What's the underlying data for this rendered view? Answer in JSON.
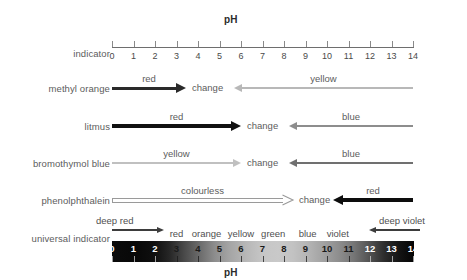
{
  "title_top": "pH",
  "title_bottom": "pH",
  "scale": {
    "min": 0,
    "max": 14,
    "ticks": [
      "0",
      "1",
      "2",
      "3",
      "4",
      "5",
      "6",
      "7",
      "8",
      "9",
      "10",
      "11",
      "12",
      "13",
      "14"
    ]
  },
  "rows": {
    "indicator": {
      "label": "indicator"
    },
    "methyl_orange": {
      "label": "methyl orange",
      "left_color_label": "red",
      "change_label": "change",
      "right_color_label": "yellow",
      "left_color": "#2a2a2a",
      "right_color": "#b8b8b8"
    },
    "litmus": {
      "label": "litmus",
      "left_color_label": "red",
      "change_label": "change",
      "right_color_label": "blue",
      "left_color": "#111111",
      "right_color": "#8d8d8d"
    },
    "bromothymol_blue": {
      "label": "bromothymol blue",
      "left_color_label": "yellow",
      "change_label": "change",
      "right_color_label": "blue",
      "left_color": "#c0c0c0",
      "right_color": "#707070"
    },
    "phenolphthalein": {
      "label": "phenolphthalein",
      "left_color_label": "colourless",
      "change_label": "change",
      "right_color_label": "red",
      "left_color": "#9a9a9a",
      "right_color": "#0d0d0d"
    },
    "universal_indicator": {
      "label": "universal indicator",
      "deep_left_label": "deep red",
      "deep_right_label": "deep violet",
      "color_labels": [
        "red",
        "orange",
        "yellow",
        "green",
        "blue",
        "violet"
      ],
      "bar_numbers": [
        "0",
        "1",
        "2",
        "3",
        "4",
        "5",
        "6",
        "7",
        "8",
        "9",
        "10",
        "11",
        "12",
        "13",
        "14"
      ]
    }
  },
  "chart_data": {
    "type": "bar",
    "title": "pH",
    "xlabel": "pH",
    "ylabel": "",
    "xlim": [
      0,
      14
    ],
    "grid": false,
    "legend": "none",
    "categories": [
      "0",
      "1",
      "2",
      "3",
      "4",
      "5",
      "6",
      "7",
      "8",
      "9",
      "10",
      "11",
      "12",
      "13",
      "14"
    ],
    "series": [
      {
        "name": "methyl orange",
        "segments": [
          {
            "label": "red",
            "from": 0.0,
            "to": 3.4,
            "direction": "right",
            "color": "#2a2a2a"
          },
          {
            "label": "change",
            "from": 3.4,
            "to": 5.7,
            "direction": "none",
            "color": "#5c5c5c"
          },
          {
            "label": "yellow",
            "from": 5.7,
            "to": 14.0,
            "direction": "left",
            "color": "#b8b8b8"
          }
        ]
      },
      {
        "name": "litmus",
        "segments": [
          {
            "label": "red",
            "from": 0.0,
            "to": 6.0,
            "direction": "right",
            "color": "#111111"
          },
          {
            "label": "change",
            "from": 6.0,
            "to": 8.3,
            "direction": "none",
            "color": "#5c5c5c"
          },
          {
            "label": "blue",
            "from": 8.3,
            "to": 14.0,
            "direction": "left",
            "color": "#8d8d8d"
          }
        ]
      },
      {
        "name": "bromothymol blue",
        "segments": [
          {
            "label": "yellow",
            "from": 0.0,
            "to": 6.0,
            "direction": "right",
            "color": "#c0c0c0"
          },
          {
            "label": "change",
            "from": 6.0,
            "to": 8.3,
            "direction": "none",
            "color": "#5c5c5c"
          },
          {
            "label": "blue",
            "from": 8.3,
            "to": 14.0,
            "direction": "left",
            "color": "#707070"
          }
        ]
      },
      {
        "name": "phenolphthalein",
        "segments": [
          {
            "label": "colourless",
            "from": 0.0,
            "to": 8.4,
            "direction": "right",
            "color": "#9a9a9a"
          },
          {
            "label": "change",
            "from": 8.4,
            "to": 10.2,
            "direction": "none",
            "color": "#5c5c5c"
          },
          {
            "label": "red",
            "from": 10.2,
            "to": 14.0,
            "direction": "left",
            "color": "#0d0d0d"
          }
        ]
      },
      {
        "name": "universal indicator",
        "segments": [
          {
            "label": "deep red",
            "from": 0.0,
            "to": 2.4,
            "direction": "right",
            "color": "#4a4a4a"
          },
          {
            "label": "red",
            "from": 2.4,
            "to": 3.5,
            "direction": "none",
            "color": "#4f4f4f"
          },
          {
            "label": "orange",
            "from": 3.5,
            "to": 5.0,
            "direction": "none",
            "color": "#4f4f4f"
          },
          {
            "label": "yellow",
            "from": 5.0,
            "to": 6.8,
            "direction": "none",
            "color": "#4f4f4f"
          },
          {
            "label": "green",
            "from": 6.8,
            "to": 8.4,
            "direction": "none",
            "color": "#4f4f4f"
          },
          {
            "label": "blue",
            "from": 8.4,
            "to": 10.0,
            "direction": "none",
            "color": "#4f4f4f"
          },
          {
            "label": "violet",
            "from": 10.0,
            "to": 11.4,
            "direction": "none",
            "color": "#4f4f4f"
          },
          {
            "label": "deep violet",
            "from": 11.4,
            "to": 14.0,
            "direction": "left",
            "color": "#4a4a4a"
          }
        ]
      }
    ]
  }
}
